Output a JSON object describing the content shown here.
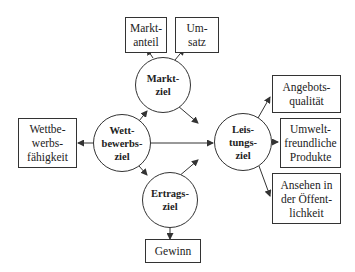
{
  "diagram": {
    "circles": {
      "markt": "Markt-\nziel",
      "wett": "Wett-\nbewerbs-\nziel",
      "leistung": "Leis-\ntungs-\nziel",
      "ertrag": "Ertrags-\nziel"
    },
    "boxes": {
      "marktanteil": "Markt-\nanteil",
      "umsatz": "Um-\nsatz",
      "wettbewerbsfaehigkeit": "Wettbe-\nwerbs-\nfähigkeit",
      "angebotsqualitaet": "Angebots-\nqualität",
      "umweltfreundlich": "Umwelt-\nfreundliche\nProdukte",
      "ansehen": "Ansehen in\nder Öffent-\nlichkeit",
      "gewinn": "Gewinn"
    },
    "edges": [
      {
        "from": "Wettbewerbsziel",
        "to": "Marktziel"
      },
      {
        "from": "Wettbewerbsziel",
        "to": "Ertragsziel"
      },
      {
        "from": "Wettbewerbsziel",
        "to": "Leistungsziel"
      },
      {
        "from": "Wettbewerbsziel",
        "to": "Wettbewerbsfähigkeit"
      },
      {
        "from": "Marktziel",
        "to": "Leistungsziel"
      },
      {
        "from": "Marktziel",
        "to": "Marktanteil"
      },
      {
        "from": "Marktziel",
        "to": "Umsatz"
      },
      {
        "from": "Ertragsziel",
        "to": "Leistungsziel"
      },
      {
        "from": "Ertragsziel",
        "to": "Gewinn"
      },
      {
        "from": "Leistungsziel",
        "to": "Angebotsqualität"
      },
      {
        "from": "Leistungsziel",
        "to": "Umweltfreundliche Produkte"
      },
      {
        "from": "Leistungsziel",
        "to": "Ansehen in der Öffentlichkeit"
      }
    ]
  }
}
